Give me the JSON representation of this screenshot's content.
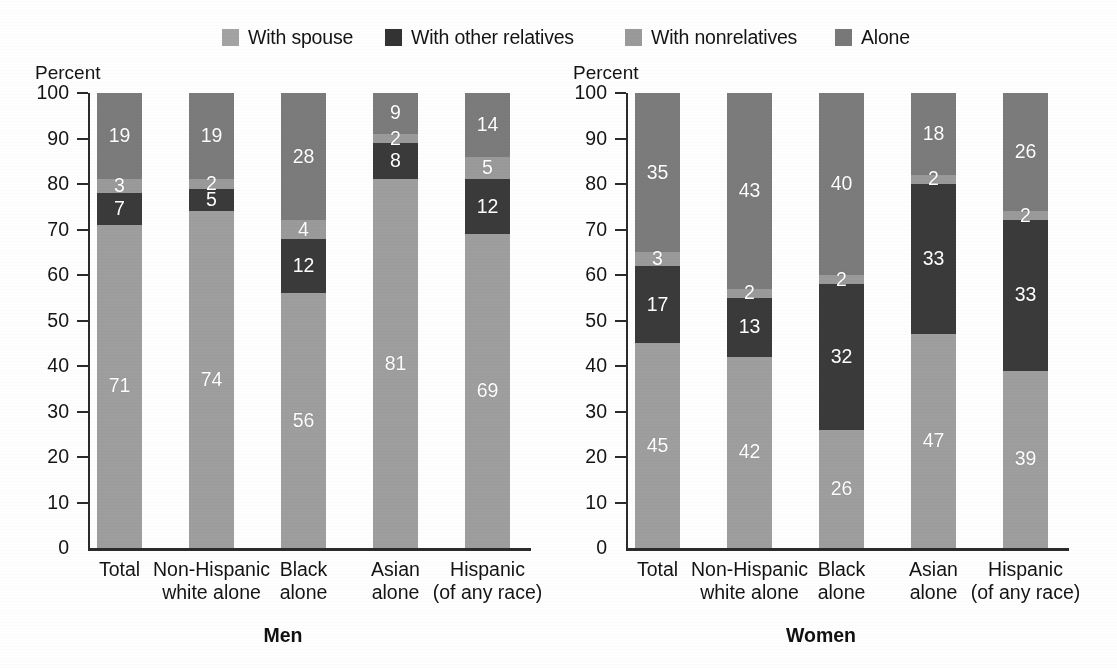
{
  "colors": {
    "with_spouse": "#9e9e9e",
    "with_other_relatives": "#3a3a3a",
    "with_nonrelatives": "#9a9a9a",
    "alone": "#7b7b7b",
    "axis": "#2b2b2b",
    "text": "#141414",
    "value_text": "#ffffff",
    "background": "#fefefe"
  },
  "legend": {
    "items": [
      {
        "label": "With spouse",
        "color": "#a3a3a3",
        "key": "with_spouse"
      },
      {
        "label": "With other relatives",
        "color": "#333333",
        "key": "with_other_relatives"
      },
      {
        "label": "With nonrelatives",
        "color": "#9a9a9a",
        "key": "with_nonrelatives"
      },
      {
        "label": "Alone",
        "color": "#787878",
        "key": "alone"
      }
    ]
  },
  "chart_data": [
    {
      "type": "bar",
      "stacked": true,
      "title": "Men",
      "ylabel": "Percent",
      "xlabel": "",
      "ylim": [
        0,
        100
      ],
      "yticks": [
        0,
        10,
        20,
        30,
        40,
        50,
        60,
        70,
        80,
        90,
        100
      ],
      "grid": false,
      "legend_position": "top",
      "categories": [
        "Total",
        "Non-Hispanic white alone",
        "Black alone",
        "Asian alone",
        "Hispanic (of any race)"
      ],
      "category_lines": [
        [
          "Total",
          ""
        ],
        [
          "Non-Hispanic",
          "white alone"
        ],
        [
          "Black",
          "alone"
        ],
        [
          "Asian",
          "alone"
        ],
        [
          "Hispanic",
          "(of any race)"
        ]
      ],
      "series": [
        {
          "name": "With spouse",
          "values": [
            71,
            74,
            56,
            81,
            69
          ]
        },
        {
          "name": "With other relatives",
          "values": [
            7,
            5,
            12,
            8,
            12
          ]
        },
        {
          "name": "With nonrelatives",
          "values": [
            3,
            2,
            4,
            2,
            5
          ]
        },
        {
          "name": "Alone",
          "values": [
            19,
            19,
            28,
            9,
            14
          ]
        }
      ]
    },
    {
      "type": "bar",
      "stacked": true,
      "title": "Women",
      "ylabel": "Percent",
      "xlabel": "",
      "ylim": [
        0,
        100
      ],
      "yticks": [
        0,
        10,
        20,
        30,
        40,
        50,
        60,
        70,
        80,
        90,
        100
      ],
      "grid": false,
      "legend_position": "top",
      "categories": [
        "Total",
        "Non-Hispanic white alone",
        "Black alone",
        "Asian alone",
        "Hispanic (of any race)"
      ],
      "category_lines": [
        [
          "Total",
          ""
        ],
        [
          "Non-Hispanic",
          "white alone"
        ],
        [
          "Black",
          "alone"
        ],
        [
          "Asian",
          "alone"
        ],
        [
          "Hispanic",
          "(of any race)"
        ]
      ],
      "series": [
        {
          "name": "With spouse",
          "values": [
            45,
            42,
            26,
            47,
            39
          ]
        },
        {
          "name": "With other relatives",
          "values": [
            17,
            13,
            32,
            33,
            33
          ]
        },
        {
          "name": "With nonrelatives",
          "values": [
            3,
            2,
            2,
            2,
            2
          ]
        },
        {
          "name": "Alone",
          "values": [
            35,
            43,
            40,
            18,
            26
          ]
        }
      ]
    }
  ]
}
